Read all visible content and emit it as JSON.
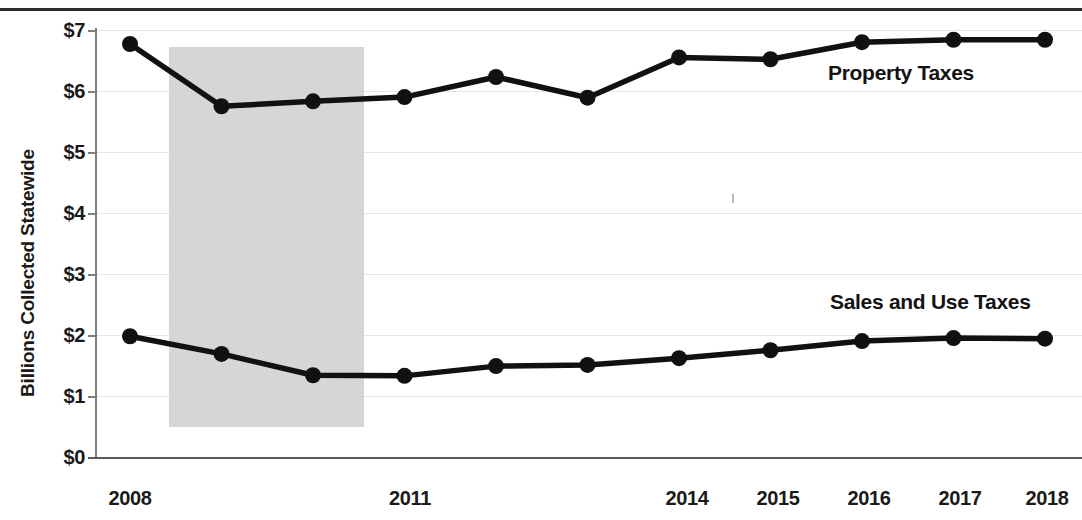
{
  "chart_data": {
    "type": "line",
    "title": "",
    "xlabel": "",
    "ylabel": "Billions Collected Statewide",
    "x": [
      2008,
      2009,
      2010,
      2011,
      2012,
      2013,
      2014,
      2015,
      2016,
      2017,
      2018
    ],
    "x_tick_labels": [
      "2008",
      "2011",
      "2014",
      "2015",
      "2016",
      "2017",
      "2018"
    ],
    "x_tick_values": [
      2008,
      2011,
      2014,
      2015,
      2016,
      2017,
      2018
    ],
    "y_tick_labels": [
      "$0",
      "$1",
      "$2",
      "$3",
      "$4",
      "$5",
      "$6",
      "$7"
    ],
    "y_tick_values": [
      0,
      1,
      2,
      3,
      4,
      5,
      6,
      7
    ],
    "ylim": [
      0,
      7
    ],
    "xlim": [
      2008,
      2018
    ],
    "grid": true,
    "legend_position": "inline-right",
    "series": [
      {
        "name": "Property Taxes",
        "color": "#111111",
        "values": [
          6.77,
          5.75,
          5.83,
          5.9,
          6.23,
          5.89,
          6.55,
          6.52,
          6.8,
          6.84,
          6.84
        ]
      },
      {
        "name": "Sales and Use Taxes",
        "color": "#111111",
        "values": [
          1.98,
          1.69,
          1.34,
          1.33,
          1.49,
          1.51,
          1.62,
          1.75,
          1.9,
          1.95,
          1.94
        ]
      }
    ],
    "annotations": [
      {
        "name": "recession-band",
        "label": "",
        "x_start": 2009,
        "x_end": 2011,
        "color": "#d2d2d2"
      }
    ]
  },
  "labels": {
    "property_taxes": "Property Taxes",
    "sales_and_use_taxes": "Sales and Use Taxes",
    "y_axis_title": "Billions Collected Statewide",
    "y0": "$0",
    "y1": "$1",
    "y2": "$2",
    "y3": "$3",
    "y4": "$4",
    "y5": "$5",
    "y6": "$6",
    "y7": "$7",
    "x2008": "2008",
    "x2011": "2011",
    "x2014": "2014",
    "x2015": "2015",
    "x2016": "2016",
    "x2017": "2017",
    "x2018": "2018"
  }
}
